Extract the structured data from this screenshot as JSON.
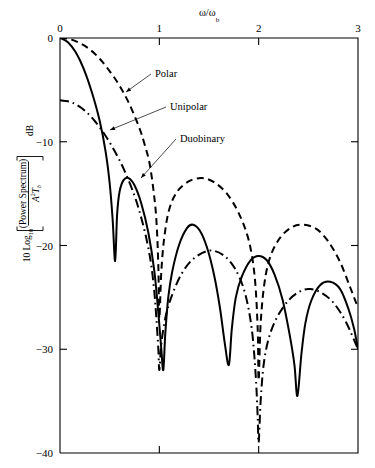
{
  "figure": {
    "background": "#ffffff",
    "ink": "#000000"
  },
  "chart_data": {
    "type": "line",
    "title": "",
    "xlabel": "ω/ωₕ",
    "xlabel_parts": {
      "numerator": "ω",
      "denominator": "ω",
      "subscript": "b"
    },
    "ylabel": "10 Log₁₀ [ (Power Spectrum) / A²Tₕ ]   dB",
    "ylabel_parts": {
      "prefix": "10 Log",
      "prefix_sub": "10",
      "numerator": "(Power Spectrum)",
      "denominator_a": "A",
      "denominator_exp": "2",
      "denominator_t": "T",
      "denominator_sub": "b",
      "units": "dB"
    },
    "xlim": [
      0,
      3
    ],
    "ylim": [
      -40,
      0
    ],
    "xticks": [
      0,
      1,
      2,
      3
    ],
    "xticklabels": [
      "0",
      "1",
      "2",
      "3"
    ],
    "yticks": [
      0,
      -10,
      -20,
      -30,
      -40
    ],
    "yticklabels": [
      "0",
      "−10",
      "−20",
      "−30",
      "−40"
    ],
    "grid": false,
    "legend_position": "inline-annotations",
    "axis_position": {
      "x_axis_on": "top",
      "y_axis_on": "left"
    },
    "series": [
      {
        "name": "Polar",
        "style": "dashed",
        "nulls": [
          1,
          2,
          3
        ],
        "peaks_db": [
          0,
          -13.5,
          -18.0
        ],
        "peak_positions": [
          0,
          1.43,
          2.45
        ],
        "null_depths_db": [
          -27,
          -33,
          -26
        ],
        "points": [
          [
            0.0,
            0.0
          ],
          [
            0.1,
            -0.1
          ],
          [
            0.2,
            -0.5
          ],
          [
            0.3,
            -1.1
          ],
          [
            0.4,
            -2.0
          ],
          [
            0.5,
            -3.2
          ],
          [
            0.6,
            -4.6
          ],
          [
            0.7,
            -6.4
          ],
          [
            0.8,
            -8.7
          ],
          [
            0.85,
            -10.2
          ],
          [
            0.9,
            -12.0
          ],
          [
            0.94,
            -14.6
          ],
          [
            0.97,
            -17.5
          ],
          [
            0.99,
            -22.0
          ],
          [
            1.0,
            -27.0
          ],
          [
            1.02,
            -22.5
          ],
          [
            1.05,
            -19.2
          ],
          [
            1.1,
            -16.5
          ],
          [
            1.18,
            -14.8
          ],
          [
            1.3,
            -13.8
          ],
          [
            1.43,
            -13.5
          ],
          [
            1.55,
            -13.9
          ],
          [
            1.68,
            -15.0
          ],
          [
            1.8,
            -16.9
          ],
          [
            1.9,
            -19.5
          ],
          [
            1.96,
            -23.0
          ],
          [
            1.99,
            -28.0
          ],
          [
            2.0,
            -33.0
          ],
          [
            2.02,
            -27.5
          ],
          [
            2.06,
            -23.5
          ],
          [
            2.12,
            -21.0
          ],
          [
            2.22,
            -19.2
          ],
          [
            2.34,
            -18.2
          ],
          [
            2.45,
            -18.0
          ],
          [
            2.58,
            -18.4
          ],
          [
            2.7,
            -19.6
          ],
          [
            2.82,
            -21.6
          ],
          [
            2.92,
            -24.0
          ],
          [
            3.0,
            -26.0
          ]
        ]
      },
      {
        "name": "Unipolar",
        "style": "dash-dot",
        "start_db": -6.0,
        "nulls": [
          1,
          2
        ],
        "peaks_db": [
          -6.0,
          -20.5,
          -24.2
        ],
        "peak_positions": [
          0,
          1.5,
          2.5
        ],
        "null_depths_db": [
          -32,
          -39,
          -26
        ],
        "points": [
          [
            0.0,
            -6.0
          ],
          [
            0.08,
            -6.1
          ],
          [
            0.16,
            -6.4
          ],
          [
            0.25,
            -7.0
          ],
          [
            0.35,
            -8.0
          ],
          [
            0.45,
            -9.3
          ],
          [
            0.55,
            -10.9
          ],
          [
            0.65,
            -12.8
          ],
          [
            0.75,
            -15.2
          ],
          [
            0.82,
            -17.4
          ],
          [
            0.88,
            -19.8
          ],
          [
            0.92,
            -22.0
          ],
          [
            0.95,
            -24.5
          ],
          [
            0.97,
            -27.0
          ],
          [
            0.99,
            -30.0
          ],
          [
            1.0,
            -32.0
          ],
          [
            1.02,
            -29.5
          ],
          [
            1.06,
            -27.0
          ],
          [
            1.12,
            -25.0
          ],
          [
            1.22,
            -22.8
          ],
          [
            1.34,
            -21.3
          ],
          [
            1.5,
            -20.5
          ],
          [
            1.64,
            -20.9
          ],
          [
            1.76,
            -22.2
          ],
          [
            1.86,
            -24.5
          ],
          [
            1.93,
            -28.0
          ],
          [
            1.97,
            -32.5
          ],
          [
            1.99,
            -36.5
          ],
          [
            2.0,
            -39.0
          ],
          [
            2.02,
            -35.0
          ],
          [
            2.05,
            -31.5
          ],
          [
            2.1,
            -29.0
          ],
          [
            2.18,
            -27.0
          ],
          [
            2.3,
            -25.3
          ],
          [
            2.42,
            -24.4
          ],
          [
            2.52,
            -24.2
          ],
          [
            2.64,
            -24.6
          ],
          [
            2.76,
            -25.6
          ],
          [
            2.88,
            -27.4
          ],
          [
            3.0,
            -30.0
          ]
        ]
      },
      {
        "name": "Duobinary",
        "style": "solid",
        "nulls": [
          0.85,
          1.2,
          1.75,
          2.3,
          2.85
        ],
        "peaks_db": [
          0,
          -13.5,
          -18.0,
          -21.0,
          -23.5,
          -24.5
        ],
        "peak_positions": [
          0,
          0.55,
          1.32,
          1.62,
          2.25,
          2.62
        ],
        "null_depths_db": [
          -21.5,
          -33,
          -31.5,
          -32,
          -35,
          -35,
          -30
        ],
        "points": [
          [
            0.0,
            0.0
          ],
          [
            0.08,
            -0.4
          ],
          [
            0.16,
            -1.4
          ],
          [
            0.24,
            -3.0
          ],
          [
            0.32,
            -5.2
          ],
          [
            0.4,
            -8.0
          ],
          [
            0.46,
            -11.0
          ],
          [
            0.5,
            -14.0
          ],
          [
            0.53,
            -17.5
          ],
          [
            0.555,
            -21.5
          ],
          [
            0.575,
            -17.0
          ],
          [
            0.6,
            -14.8
          ],
          [
            0.64,
            -13.7
          ],
          [
            0.69,
            -13.5
          ],
          [
            0.75,
            -14.2
          ],
          [
            0.82,
            -16.0
          ],
          [
            0.89,
            -18.8
          ],
          [
            0.95,
            -22.5
          ],
          [
            0.99,
            -26.5
          ],
          [
            1.02,
            -30.0
          ],
          [
            1.04,
            -32.0
          ],
          [
            1.06,
            -28.5
          ],
          [
            1.09,
            -25.0
          ],
          [
            1.13,
            -22.5
          ],
          [
            1.2,
            -19.9
          ],
          [
            1.28,
            -18.3
          ],
          [
            1.34,
            -18.0
          ],
          [
            1.41,
            -18.6
          ],
          [
            1.48,
            -20.2
          ],
          [
            1.55,
            -22.8
          ],
          [
            1.61,
            -26.0
          ],
          [
            1.66,
            -29.5
          ],
          [
            1.7,
            -31.5
          ],
          [
            1.73,
            -28.0
          ],
          [
            1.77,
            -25.0
          ],
          [
            1.83,
            -23.0
          ],
          [
            1.92,
            -21.4
          ],
          [
            2.0,
            -21.0
          ],
          [
            2.08,
            -21.4
          ],
          [
            2.16,
            -22.8
          ],
          [
            2.24,
            -25.2
          ],
          [
            2.31,
            -28.5
          ],
          [
            2.36,
            -31.5
          ],
          [
            2.39,
            -34.5
          ],
          [
            2.43,
            -30.5
          ],
          [
            2.47,
            -27.5
          ],
          [
            2.53,
            -25.3
          ],
          [
            2.62,
            -23.8
          ],
          [
            2.72,
            -23.5
          ],
          [
            2.82,
            -24.2
          ],
          [
            2.9,
            -26.0
          ],
          [
            2.96,
            -28.0
          ],
          [
            3.0,
            -30.0
          ]
        ]
      }
    ],
    "annotations": [
      {
        "label": "Polar",
        "text_x": 155,
        "text_y": 77,
        "leader_to_x": 126,
        "leader_to_y": 92
      },
      {
        "label": "Unipolar",
        "text_x": 170,
        "text_y": 110,
        "leader_to_x": 110,
        "leader_to_y": 130
      },
      {
        "label": "Duobinary",
        "text_x": 180,
        "text_y": 142,
        "leader_to_x": 141,
        "leader_to_y": 178
      }
    ]
  }
}
